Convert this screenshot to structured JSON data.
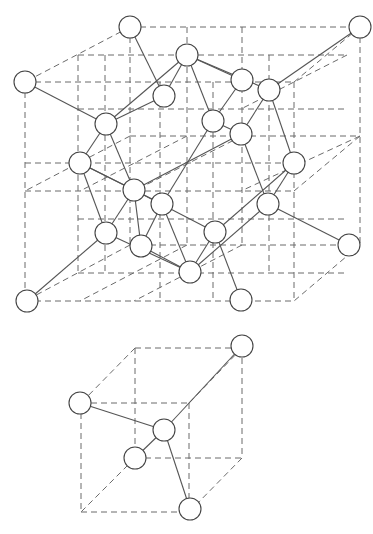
{
  "colors": {
    "background": "#ffffff",
    "lattice_line": "#6b6b6b",
    "bond_line": "#555555",
    "atom_stroke": "#444444",
    "atom_fill": "#ffffff"
  },
  "atom_radius": 11,
  "main_cell": {
    "lattice_lines": [
      [
        130,
        27,
        360,
        27
      ],
      [
        25,
        82,
        294,
        82
      ],
      [
        25,
        163,
        294,
        163
      ],
      [
        25,
        301,
        294,
        301
      ],
      [
        130,
        27,
        25,
        82
      ],
      [
        360,
        27,
        294,
        82
      ],
      [
        360,
        245,
        294,
        301
      ],
      [
        130,
        245,
        25,
        301
      ],
      [
        78,
        55,
        347,
        55
      ],
      [
        78,
        55,
        78,
        273
      ],
      [
        78,
        273,
        347,
        273
      ],
      [
        187,
        27,
        187,
        245
      ],
      [
        242,
        27,
        242,
        245
      ],
      [
        130,
        136,
        360,
        136
      ],
      [
        25,
        191,
        294,
        191
      ],
      [
        130,
        27,
        130,
        245
      ],
      [
        360,
        27,
        360,
        245
      ],
      [
        25,
        82,
        25,
        301
      ],
      [
        294,
        82,
        294,
        301
      ],
      [
        130,
        245,
        360,
        245
      ],
      [
        78,
        109,
        347,
        109
      ],
      [
        78,
        219,
        347,
        219
      ],
      [
        160,
        82,
        160,
        301
      ],
      [
        213,
        82,
        213,
        301
      ],
      [
        187,
        136,
        80,
        191
      ],
      [
        242,
        136,
        134,
        191
      ],
      [
        347,
        55,
        241,
        109
      ],
      [
        130,
        136,
        25,
        191
      ],
      [
        360,
        136,
        294,
        191
      ],
      [
        187,
        245,
        80,
        301
      ],
      [
        242,
        245,
        134,
        301
      ],
      [
        360,
        136,
        241,
        191
      ],
      [
        105,
        55,
        105,
        273
      ],
      [
        269,
        55,
        269,
        273
      ]
    ],
    "bonds": [
      [
        130,
        27,
        164,
        96
      ],
      [
        25,
        82,
        106,
        124
      ],
      [
        187,
        55,
        164,
        96
      ],
      [
        187,
        55,
        213,
        121
      ],
      [
        187,
        55,
        269,
        90
      ],
      [
        187,
        55,
        106,
        124
      ],
      [
        242,
        80,
        213,
        121
      ],
      [
        242,
        80,
        187,
        55
      ],
      [
        269,
        90,
        241,
        134
      ],
      [
        269,
        90,
        294,
        163
      ],
      [
        360,
        27,
        269,
        90
      ],
      [
        164,
        96,
        106,
        124
      ],
      [
        213,
        121,
        241,
        134
      ],
      [
        213,
        121,
        162,
        204
      ],
      [
        106,
        124,
        80,
        163
      ],
      [
        106,
        124,
        134,
        190
      ],
      [
        241,
        134,
        268,
        204
      ],
      [
        241,
        134,
        134,
        190
      ],
      [
        80,
        163,
        106,
        233
      ],
      [
        80,
        163,
        162,
        204
      ],
      [
        80,
        163,
        134,
        190
      ],
      [
        294,
        163,
        215,
        232
      ],
      [
        294,
        163,
        268,
        204
      ],
      [
        134,
        190,
        106,
        233
      ],
      [
        134,
        190,
        215,
        232
      ],
      [
        162,
        204,
        141,
        246
      ],
      [
        162,
        204,
        190,
        272
      ],
      [
        268,
        204,
        349,
        245
      ],
      [
        268,
        204,
        190,
        272
      ],
      [
        106,
        233,
        27,
        301
      ],
      [
        106,
        233,
        190,
        272
      ],
      [
        141,
        246,
        134,
        190
      ],
      [
        215,
        232,
        241,
        300
      ],
      [
        215,
        232,
        190,
        272
      ],
      [
        141,
        246,
        190,
        272
      ]
    ],
    "atoms": [
      {
        "id": "A1",
        "x": 130,
        "y": 27
      },
      {
        "id": "A2",
        "x": 360,
        "y": 27
      },
      {
        "id": "A3",
        "x": 25,
        "y": 82
      },
      {
        "id": "A4",
        "x": 187,
        "y": 55
      },
      {
        "id": "A5",
        "x": 242,
        "y": 80
      },
      {
        "id": "A6",
        "x": 269,
        "y": 90
      },
      {
        "id": "A7",
        "x": 164,
        "y": 96
      },
      {
        "id": "A8",
        "x": 213,
        "y": 121
      },
      {
        "id": "A9",
        "x": 106,
        "y": 124
      },
      {
        "id": "A10",
        "x": 241,
        "y": 134
      },
      {
        "id": "A11",
        "x": 80,
        "y": 163
      },
      {
        "id": "A12",
        "x": 294,
        "y": 163
      },
      {
        "id": "A13",
        "x": 134,
        "y": 190
      },
      {
        "id": "A14",
        "x": 162,
        "y": 204
      },
      {
        "id": "A15",
        "x": 268,
        "y": 204
      },
      {
        "id": "A16",
        "x": 106,
        "y": 233
      },
      {
        "id": "A17",
        "x": 215,
        "y": 232
      },
      {
        "id": "A18",
        "x": 141,
        "y": 246
      },
      {
        "id": "A19",
        "x": 349,
        "y": 245
      },
      {
        "id": "A20",
        "x": 190,
        "y": 272
      },
      {
        "id": "A21",
        "x": 27,
        "y": 301
      },
      {
        "id": "A22",
        "x": 241,
        "y": 300
      }
    ]
  },
  "tetrahedral_unit": {
    "lattice_lines": [
      [
        135,
        348,
        242,
        348
      ],
      [
        81,
        403,
        189,
        403
      ],
      [
        81,
        403,
        81,
        512
      ],
      [
        81,
        512,
        189,
        512
      ],
      [
        135,
        348,
        135,
        458
      ],
      [
        242,
        348,
        242,
        458
      ],
      [
        189,
        403,
        189,
        512
      ],
      [
        135,
        458,
        242,
        458
      ],
      [
        135,
        348,
        81,
        403
      ],
      [
        242,
        348,
        189,
        403
      ],
      [
        242,
        458,
        189,
        512
      ],
      [
        135,
        458,
        81,
        512
      ]
    ],
    "bonds": [
      [
        242,
        346,
        164,
        430
      ],
      [
        80,
        403,
        164,
        430
      ],
      [
        164,
        430,
        135,
        458
      ],
      [
        164,
        430,
        190,
        509
      ]
    ],
    "atoms": [
      {
        "id": "B1",
        "x": 242,
        "y": 346
      },
      {
        "id": "B2",
        "x": 80,
        "y": 403
      },
      {
        "id": "B3",
        "x": 164,
        "y": 430
      },
      {
        "id": "B4",
        "x": 135,
        "y": 458
      },
      {
        "id": "B5",
        "x": 190,
        "y": 509
      }
    ]
  }
}
